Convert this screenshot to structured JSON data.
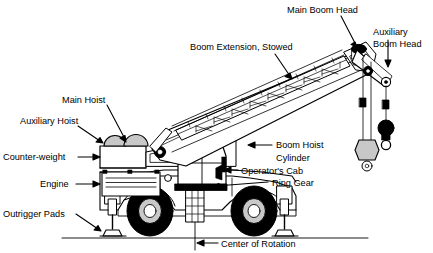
{
  "diagram": {
    "line_color": "#000000",
    "fill_white": "#ffffff",
    "fill_grey": "#c8c8c8",
    "fill_black": "#000000",
    "background": "#ffffff"
  },
  "labels": {
    "main_boom_head": "Main Boom Head",
    "auxiliary_boom_head_l1": "Auxiliary",
    "auxiliary_boom_head_l2": "Boom Head",
    "boom_extension_stowed": "Boom Extension, Stowed",
    "main_hoist": "Main Hoist",
    "auxiliary_hoist": "Auxiliary Hoist",
    "counter_weight": "Counter-weight",
    "engine": "Engine",
    "outrigger_pads": "Outrigger Pads",
    "boom_hoist_cylinder_l1": "Boom  Hoist",
    "boom_hoist_cylinder_l2": "Cylinder",
    "operators_cab": "Operator's Cab",
    "ring_gear": "Ring Gear",
    "center_of_rotation": "Center of Rotation"
  },
  "parts": {
    "main_boom": "main-boom",
    "boom_extension": "boom-extension-lattice",
    "boom_head": "main-boom-head-sheave",
    "aux_head": "auxiliary-boom-head-sheave",
    "hook_block": "main-hook-block",
    "headache_ball": "auxiliary-headache-ball",
    "hoist_drum_main": "main-hoist-drum",
    "hoist_drum_aux": "auxiliary-hoist-drum",
    "counterweight_box": "counterweight-block",
    "engine_housing": "engine-compartment",
    "cab": "operators-cab-box",
    "ring_gear_bar": "ring-gear",
    "turntable": "swing-post",
    "front_wheel": "front-wheel",
    "rear_wheel": "rear-wheel",
    "outrigger_left": "left-outrigger-jack",
    "outrigger_right": "right-outrigger-jack",
    "ground_line": "ground-line",
    "rotation_axis": "center-of-rotation-axis",
    "boom_cylinder": "boom-hoist-cylinder"
  }
}
